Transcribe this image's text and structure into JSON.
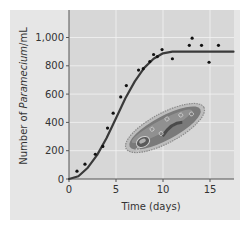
{
  "chart_data": {
    "type": "scatter",
    "title": "",
    "xlabel": "Time (days)",
    "ylabel_parts": [
      "Number of ",
      "Paramecium",
      "/mL"
    ],
    "ylabel": "Number of Paramecium/mL",
    "xlim": [
      0,
      17.5
    ],
    "ylim": [
      0,
      1200
    ],
    "x_ticks": [
      0,
      5,
      10,
      15
    ],
    "x_tick_labels": [
      "0",
      "5",
      "10",
      "15"
    ],
    "y_ticks": [
      0,
      200,
      400,
      600,
      800,
      1000
    ],
    "y_tick_labels": [
      "0",
      "200",
      "400",
      "600",
      "800",
      "1,000"
    ],
    "grid": true,
    "legend": null,
    "series": [
      {
        "name": "Observed counts",
        "kind": "scatter",
        "points": [
          {
            "x": 0.85,
            "y": 55
          },
          {
            "x": 1.7,
            "y": 105
          },
          {
            "x": 2.8,
            "y": 175
          },
          {
            "x": 3.6,
            "y": 230
          },
          {
            "x": 4.1,
            "y": 360
          },
          {
            "x": 4.7,
            "y": 465
          },
          {
            "x": 5.5,
            "y": 580
          },
          {
            "x": 6.1,
            "y": 660
          },
          {
            "x": 7.4,
            "y": 770
          },
          {
            "x": 7.9,
            "y": 780
          },
          {
            "x": 8.6,
            "y": 830
          },
          {
            "x": 9.0,
            "y": 880
          },
          {
            "x": 9.4,
            "y": 865
          },
          {
            "x": 9.9,
            "y": 915
          },
          {
            "x": 11.0,
            "y": 850
          },
          {
            "x": 12.8,
            "y": 945
          },
          {
            "x": 13.1,
            "y": 995
          },
          {
            "x": 14.1,
            "y": 945
          },
          {
            "x": 14.9,
            "y": 825
          },
          {
            "x": 15.9,
            "y": 945
          }
        ]
      },
      {
        "name": "Logistic growth curve",
        "kind": "line",
        "carrying_capacity": 900,
        "points": [
          {
            "x": 0,
            "y": 0
          },
          {
            "x": 1,
            "y": 20
          },
          {
            "x": 2,
            "y": 80
          },
          {
            "x": 3,
            "y": 170
          },
          {
            "x": 4,
            "y": 290
          },
          {
            "x": 5,
            "y": 430
          },
          {
            "x": 6,
            "y": 570
          },
          {
            "x": 7,
            "y": 690
          },
          {
            "x": 8,
            "y": 785
          },
          {
            "x": 9,
            "y": 850
          },
          {
            "x": 10,
            "y": 888
          },
          {
            "x": 11,
            "y": 900
          },
          {
            "x": 12,
            "y": 900
          },
          {
            "x": 14,
            "y": 900
          },
          {
            "x": 16,
            "y": 900
          },
          {
            "x": 17.5,
            "y": 900
          }
        ]
      }
    ],
    "annotations": [
      "Paramecium illustration (decorative)"
    ]
  },
  "colors": {
    "panel_bg": "#e6e6e6",
    "plot_bg": "#d7d7d7",
    "grid": "#f2f2f2",
    "axis": "#555555",
    "curve": "#3a3a3a",
    "points": "#111111"
  },
  "layout": {
    "plot_left": 69,
    "plot_right": 234,
    "plot_top": 10,
    "plot_bottom": 179,
    "px_per_day": 9.4,
    "px_per_unit_y": 0.1415
  }
}
